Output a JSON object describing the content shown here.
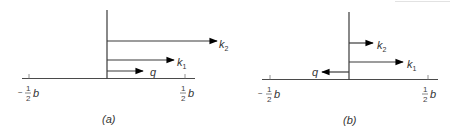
{
  "figure": {
    "panels": [
      {
        "caption": "(a)",
        "axis_left_label": {
          "sign": "−",
          "num": "1",
          "den": "2",
          "var": "b"
        },
        "axis_right_label": {
          "num": "1",
          "den": "2",
          "var": "b"
        },
        "arrows": [
          {
            "name": "k",
            "sub": "2",
            "direction": "right"
          },
          {
            "name": "k",
            "sub": "1",
            "direction": "right"
          },
          {
            "name": "q",
            "sub": "",
            "direction": "right"
          }
        ]
      },
      {
        "caption": "(b)",
        "axis_left_label": {
          "sign": "−",
          "num": "1",
          "den": "2",
          "var": "b"
        },
        "axis_right_label": {
          "num": "1",
          "den": "2",
          "var": "b"
        },
        "arrows": [
          {
            "name": "k",
            "sub": "2",
            "direction": "right"
          },
          {
            "name": "k",
            "sub": "1",
            "direction": "right"
          },
          {
            "name": "q",
            "sub": "",
            "direction": "left"
          }
        ]
      }
    ],
    "colors": {
      "line": "#3a3a3a",
      "arrowhead": "#000000",
      "text": "#333333"
    }
  }
}
